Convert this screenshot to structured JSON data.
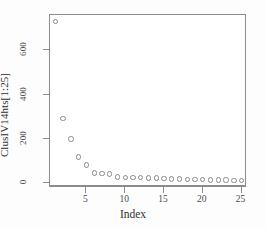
{
  "chart_data": {
    "type": "scatter",
    "title": "",
    "xlabel": "Index",
    "ylabel": "ClusIV14hts[1:25]",
    "xlim": [
      0.3,
      25.7
    ],
    "ylim": [
      -18,
      760
    ],
    "grid": false,
    "legend": null,
    "marker": "open-circle",
    "x": [
      1,
      2,
      3,
      4,
      5,
      6,
      7,
      8,
      9,
      10,
      11,
      12,
      13,
      14,
      15,
      16,
      17,
      18,
      19,
      20,
      21,
      22,
      23,
      24,
      25
    ],
    "values": [
      730,
      292,
      200,
      117,
      82,
      45,
      42,
      40,
      27,
      26,
      25,
      24,
      23,
      22,
      21,
      19,
      18,
      17,
      16,
      15,
      14,
      14,
      13,
      12,
      12
    ],
    "x_ticks": [
      5,
      10,
      15,
      20,
      25
    ],
    "y_ticks": [
      0,
      200,
      400,
      600
    ],
    "series": [
      {
        "name": "ClusIV14hts[1:25]",
        "values": [
          730,
          292,
          200,
          117,
          82,
          45,
          42,
          40,
          27,
          26,
          25,
          24,
          23,
          22,
          21,
          19,
          18,
          17,
          16,
          15,
          14,
          14,
          13,
          12,
          12
        ]
      }
    ]
  },
  "axes": {
    "x_title": "Index",
    "y_title": "ClusIV14hts[1:25]",
    "x_tick_labels": [
      "5",
      "10",
      "15",
      "20",
      "25"
    ],
    "y_tick_labels": [
      "0",
      "200",
      "400",
      "600"
    ]
  },
  "colors": {
    "marker_stroke": "#8a8a8a",
    "frame": "#8c8c8c",
    "text": "#2e2e2e",
    "background": "#ffffff"
  }
}
